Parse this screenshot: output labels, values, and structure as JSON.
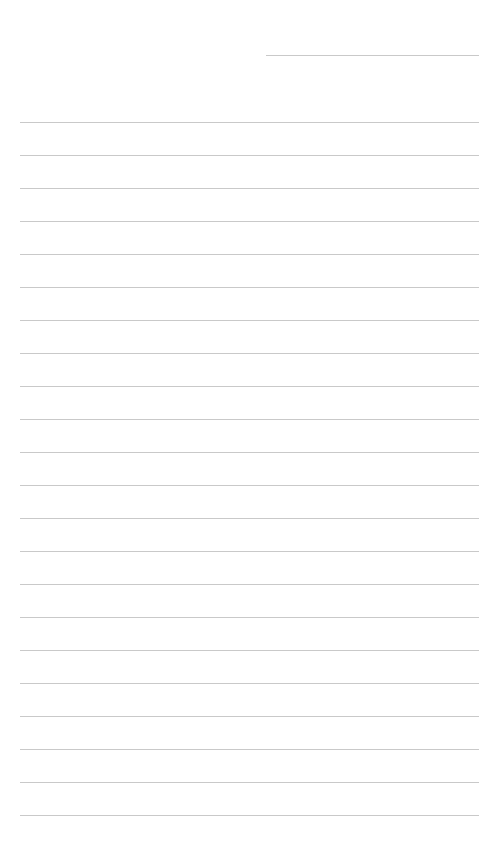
{
  "page": {
    "type": "lined-paper",
    "background": "#ffffff",
    "line_color": "#c9c9c9"
  },
  "header_line": {
    "x1": 266,
    "x2": 479,
    "y": 55
  },
  "ruled_lines": {
    "count": 22,
    "x1": 20,
    "x2": 479,
    "first_y": 122,
    "spacing": 33
  }
}
